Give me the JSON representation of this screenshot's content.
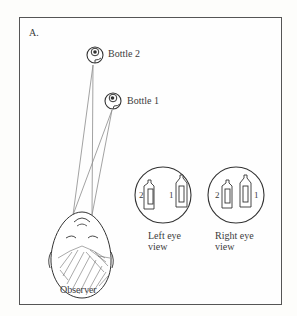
{
  "figure": {
    "panel_label": "A.",
    "bottles": [
      {
        "id": 2,
        "label": "Bottle 2"
      },
      {
        "id": 1,
        "label": "Bottle 1"
      }
    ],
    "observer_label": "Observer",
    "views": [
      {
        "name": "left-eye-view",
        "line1": "Left eye",
        "line2": "view",
        "left_number": "2",
        "right_number": "1"
      },
      {
        "name": "right-eye-view",
        "line1": "Right eye",
        "line2": "view",
        "left_number": "2",
        "right_number": "1"
      }
    ]
  }
}
